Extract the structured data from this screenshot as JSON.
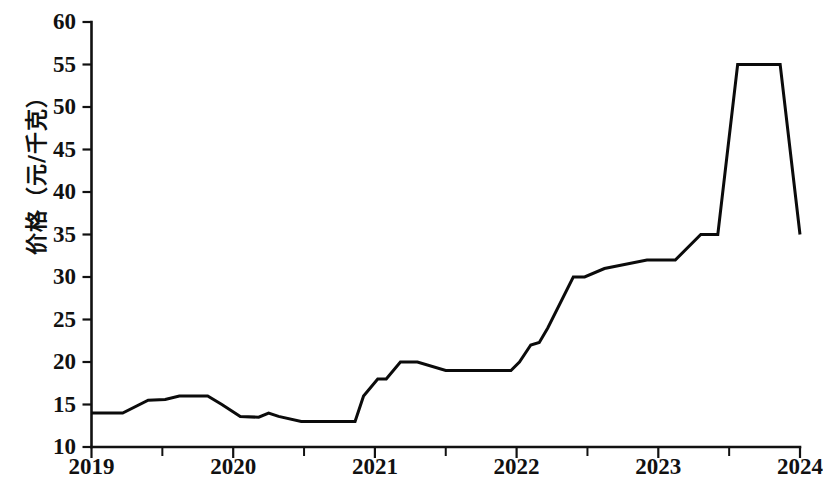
{
  "chart_data": {
    "type": "line",
    "title": "",
    "subtitle": "",
    "xlabel": "",
    "ylabel": "价格（元/千克）",
    "ylim": [
      10,
      60
    ],
    "xlim": [
      2019.0,
      2024.0
    ],
    "ytick_labels": [
      "10",
      "15",
      "20",
      "25",
      "30",
      "35",
      "40",
      "45",
      "50",
      "55",
      "60"
    ],
    "ytick_values": [
      10,
      15,
      20,
      25,
      30,
      35,
      40,
      45,
      50,
      55,
      60
    ],
    "xtick_labels": [
      "2019",
      "2020",
      "2021",
      "2022",
      "2023",
      "2024"
    ],
    "xtick_values": [
      2019,
      2020,
      2021,
      2022,
      2023,
      2024
    ],
    "x_minor_ticks": [
      2019.5,
      2020.5,
      2021.5,
      2022.5,
      2023.5
    ],
    "grid": false,
    "legend": null,
    "legend_position": "none",
    "series": [
      {
        "name": "价格",
        "color": "#0b0b0b",
        "x": [
          2019.0,
          2019.22,
          2019.4,
          2019.52,
          2019.62,
          2019.82,
          2019.92,
          2020.05,
          2020.18,
          2020.25,
          2020.32,
          2020.48,
          2020.86,
          2020.92,
          2021.02,
          2021.08,
          2021.18,
          2021.3,
          2021.5,
          2021.72,
          2021.96,
          2022.02,
          2022.1,
          2022.16,
          2022.22,
          2022.4,
          2022.48,
          2022.62,
          2022.92,
          2023.0,
          2023.12,
          2023.3,
          2023.42,
          2023.56,
          2023.78,
          2023.86,
          2024.0
        ],
        "values": [
          14.0,
          14.0,
          15.5,
          15.6,
          16.0,
          16.0,
          15.0,
          13.6,
          13.5,
          14.0,
          13.6,
          13.0,
          13.0,
          16.0,
          18.0,
          18.0,
          20.0,
          20.0,
          19.0,
          19.0,
          19.0,
          20.0,
          22.0,
          22.3,
          24.0,
          30.0,
          30.0,
          31.0,
          32.0,
          32.0,
          32.0,
          35.0,
          35.0,
          55.0,
          55.0,
          55.0,
          35.0
        ]
      }
    ]
  },
  "axes": {
    "y_axis_name": "price-axis",
    "x_axis_name": "year-axis"
  }
}
